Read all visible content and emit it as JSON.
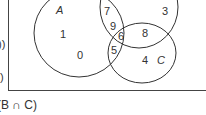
{
  "diagram": {
    "type": "venn",
    "sets": [
      {
        "name": "A",
        "label": "A"
      },
      {
        "name": "B",
        "label": "B"
      },
      {
        "name": "C",
        "label": "C"
      }
    ],
    "regions": {
      "A_only": "1",
      "A_only_2": "0",
      "A_and_B_only": "7",
      "A_and_B_only_2": "9",
      "A_and_B_and_C": "6",
      "A_and_C_only": "5",
      "B_only": "3",
      "B_and_C_only": "8",
      "C_only": "4"
    },
    "caption": "(B ∩ C)",
    "left_edge_fragments": [
      "))",
      ")"
    ]
  },
  "colors": {
    "line": "#333333",
    "background": "#ffffff"
  }
}
